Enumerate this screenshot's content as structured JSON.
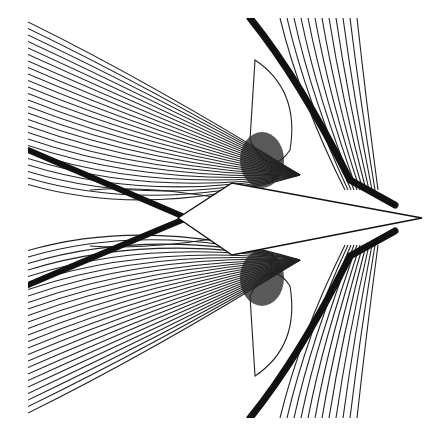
{
  "figure": {
    "colors": {
      "line": "#222222",
      "background": "#ffffff"
    },
    "body": {
      "nose": [
        422,
        218
      ],
      "upper_shoulder": [
        232,
        183
      ],
      "lower_shoulder": [
        232,
        255
      ],
      "tail": [
        178,
        218
      ]
    },
    "plot_area": {
      "x": 28,
      "y": 18,
      "width": 395,
      "height": 400
    }
  }
}
